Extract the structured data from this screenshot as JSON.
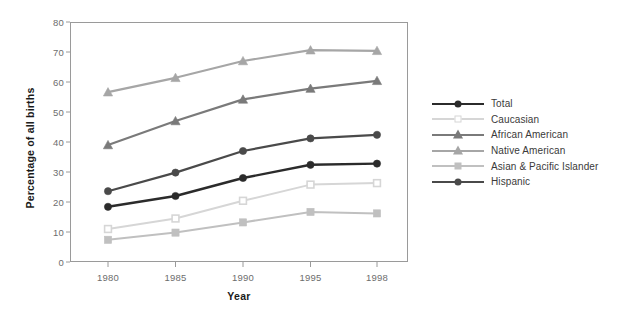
{
  "chart_data": {
    "type": "line",
    "title": "",
    "xlabel": "Year",
    "ylabel": "Percentage of all births",
    "categories": [
      "1980",
      "1985",
      "1990",
      "1995",
      "1998"
    ],
    "x_tick_labels": [
      "1980",
      "1985",
      "1990",
      "1995",
      "1998"
    ],
    "y_tick_labels": [
      "0",
      "10",
      "20",
      "30",
      "40",
      "50",
      "60",
      "70",
      "80"
    ],
    "y_ticks": [
      0,
      10,
      20,
      30,
      40,
      50,
      60,
      70,
      80
    ],
    "ylim": [
      0,
      80
    ],
    "grid": false,
    "legend_position": "right",
    "series": [
      {
        "name": "Total",
        "values": [
          18.4,
          22.0,
          28.0,
          32.4,
          32.8
        ],
        "color": "#2b2b2b",
        "marker": "circle-filled",
        "line_width": 2.4
      },
      {
        "name": "Caucasian",
        "values": [
          11.0,
          14.5,
          20.4,
          25.8,
          26.3
        ],
        "color": "#d6d6d6",
        "marker": "square-open",
        "line_width": 2.0
      },
      {
        "name": "African American",
        "values": [
          39.0,
          47.0,
          54.2,
          57.8,
          60.4
        ],
        "color": "#7a7a7a",
        "marker": "triangle",
        "line_width": 2.2
      },
      {
        "name": "Native American",
        "values": [
          56.6,
          61.4,
          67.0,
          70.6,
          70.4
        ],
        "color": "#a6a6a6",
        "marker": "triangle",
        "line_width": 2.2
      },
      {
        "name": "Asian & Pacific Islander",
        "values": [
          7.4,
          9.8,
          13.2,
          16.7,
          16.2
        ],
        "color": "#c0c0c0",
        "marker": "square-filled",
        "line_width": 2.0
      },
      {
        "name": "Hispanic",
        "values": [
          23.6,
          29.8,
          37.0,
          41.2,
          42.4
        ],
        "color": "#4a4a4a",
        "marker": "circle-filled",
        "line_width": 2.2
      }
    ]
  },
  "legend": {
    "items": [
      {
        "label": "Total"
      },
      {
        "label": "Caucasian"
      },
      {
        "label": "African American"
      },
      {
        "label": "Native American"
      },
      {
        "label": "Asian & Pacific Islander"
      },
      {
        "label": "Hispanic"
      }
    ]
  },
  "axes": {
    "x_title": "Year",
    "y_title": "Percentage of all births"
  },
  "colors": {
    "frame": "#9a9a9a",
    "tick_text": "#6d6d6d",
    "axis_title": "#1a1a1a",
    "legend_text": "#3a3a3a",
    "background": "#ffffff"
  }
}
